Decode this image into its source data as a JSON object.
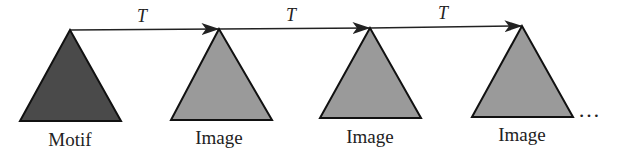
{
  "diagram": {
    "nodes": [
      {
        "label": "Motif",
        "fill": "#4a4a4a"
      },
      {
        "label": "Image",
        "fill": "#9a9a9a"
      },
      {
        "label": "Image",
        "fill": "#9a9a9a"
      },
      {
        "label": "Image",
        "fill": "#9a9a9a"
      }
    ],
    "edges": [
      {
        "label": "T"
      },
      {
        "label": "T"
      },
      {
        "label": "T"
      }
    ],
    "continuation": "…"
  }
}
